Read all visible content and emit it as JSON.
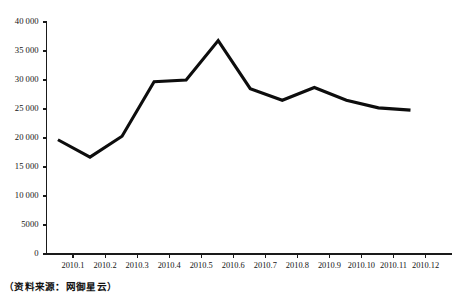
{
  "source_note": "（资料来源：网御星云）",
  "chart_data": {
    "type": "line",
    "title": "",
    "xlabel": "",
    "ylabel": "",
    "categories": [
      "2010.1",
      "2010.2",
      "2010.3",
      "2010.4",
      "2010.5",
      "2010.6",
      "2010.7",
      "2010.8",
      "2010.9",
      "2010.10",
      "2010.11",
      "2010.12"
    ],
    "values": [
      19700,
      16700,
      20300,
      29700,
      30000,
      36800,
      28500,
      26500,
      28700,
      26500,
      25200,
      24800
    ],
    "ylim": [
      0,
      40000
    ],
    "ytick_values": [
      0,
      5000,
      10000,
      15000,
      20000,
      25000,
      30000,
      35000,
      40000
    ],
    "ytick_labels": [
      "0",
      "5000",
      "10 000",
      "15 000",
      "20 000",
      "25 000",
      "30 000",
      "35 000",
      "40 000"
    ],
    "grid": false,
    "legend": null,
    "line_color": "#0d0d0d",
    "axis_color": "#1a1a1a"
  }
}
